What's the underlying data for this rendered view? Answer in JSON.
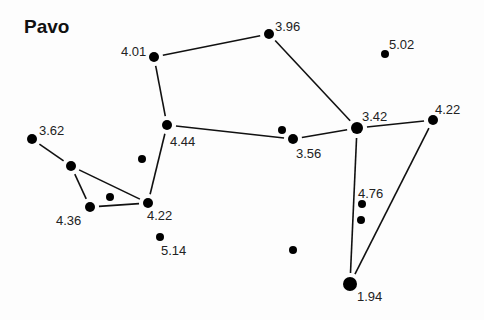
{
  "title": "Pavo",
  "stars": [
    {
      "id": "s1",
      "x": 154,
      "y": 57,
      "r": 5,
      "mag": "4.01",
      "lx": 121,
      "ly": 45
    },
    {
      "id": "s2",
      "x": 269,
      "y": 34,
      "r": 5,
      "mag": "3.96",
      "lx": 275,
      "ly": 20
    },
    {
      "id": "s3",
      "x": 385,
      "y": 54,
      "r": 4,
      "mag": "5.02",
      "lx": 389,
      "ly": 38
    },
    {
      "id": "s4",
      "x": 167,
      "y": 125,
      "r": 5,
      "mag": "4.44",
      "lx": 170,
      "ly": 135
    },
    {
      "id": "s5",
      "x": 32,
      "y": 139,
      "r": 5,
      "mag": "3.62",
      "lx": 39,
      "ly": 124
    },
    {
      "id": "s6",
      "x": 71,
      "y": 166,
      "r": 5,
      "mag": "",
      "lx": 0,
      "ly": 0
    },
    {
      "id": "s7",
      "x": 142,
      "y": 159,
      "r": 4,
      "mag": "",
      "lx": 0,
      "ly": 0
    },
    {
      "id": "s8",
      "x": 90,
      "y": 207,
      "r": 5,
      "mag": "4.36",
      "lx": 56,
      "ly": 214
    },
    {
      "id": "s9",
      "x": 110,
      "y": 197,
      "r": 4,
      "mag": "",
      "lx": 0,
      "ly": 0
    },
    {
      "id": "s10",
      "x": 148,
      "y": 203,
      "r": 5,
      "mag": "4.22",
      "lx": 147,
      "ly": 209
    },
    {
      "id": "s11",
      "x": 160,
      "y": 237,
      "r": 4,
      "mag": "5.14",
      "lx": 161,
      "ly": 244
    },
    {
      "id": "s12",
      "x": 293,
      "y": 139,
      "r": 5,
      "mag": "3.56",
      "lx": 296,
      "ly": 147
    },
    {
      "id": "s13",
      "x": 282,
      "y": 130,
      "r": 4,
      "mag": "",
      "lx": 0,
      "ly": 0
    },
    {
      "id": "s14",
      "x": 357,
      "y": 128,
      "r": 6,
      "mag": "3.42",
      "lx": 362,
      "ly": 110
    },
    {
      "id": "s15",
      "x": 433,
      "y": 120,
      "r": 5,
      "mag": "4.22",
      "lx": 435,
      "ly": 103
    },
    {
      "id": "s16",
      "x": 362,
      "y": 204,
      "r": 4,
      "mag": "4.76",
      "lx": 358,
      "ly": 187
    },
    {
      "id": "s17",
      "x": 361,
      "y": 220,
      "r": 4,
      "mag": "",
      "lx": 0,
      "ly": 0
    },
    {
      "id": "s18",
      "x": 293,
      "y": 250,
      "r": 4,
      "mag": "",
      "lx": 0,
      "ly": 0
    },
    {
      "id": "s19",
      "x": 350,
      "y": 284,
      "r": 7,
      "mag": "1.94",
      "lx": 357,
      "ly": 290
    }
  ],
  "lines": [
    [
      "s1",
      "s2"
    ],
    [
      "s2",
      "s14"
    ],
    [
      "s1",
      "s4"
    ],
    [
      "s4",
      "s12"
    ],
    [
      "s12",
      "s14"
    ],
    [
      "s14",
      "s15"
    ],
    [
      "s14",
      "s19"
    ],
    [
      "s15",
      "s19"
    ],
    [
      "s4",
      "s10"
    ],
    [
      "s5",
      "s6"
    ],
    [
      "s6",
      "s8"
    ],
    [
      "s6",
      "s10"
    ],
    [
      "s8",
      "s10"
    ]
  ],
  "colors": {
    "star": "#000000",
    "line": "#111111",
    "label": "#222222"
  }
}
